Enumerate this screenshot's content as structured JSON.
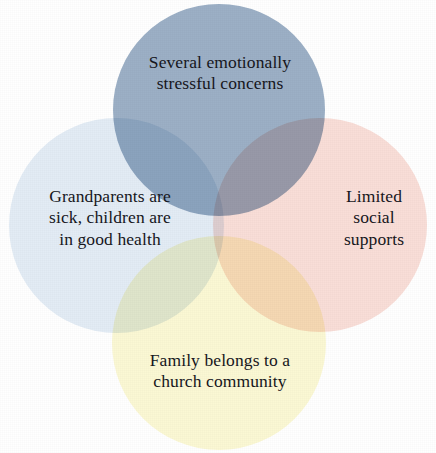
{
  "diagram": {
    "type": "venn",
    "set_count": 4,
    "background_color": "#ffffff",
    "text_color": "#16161c",
    "blend_mode": "multiply",
    "sets": [
      {
        "id": "top",
        "position": "top",
        "color": "#9cb0c6",
        "color_name": "slate blue",
        "lines": [
          "Several emotionally",
          "stressful concerns"
        ],
        "text": "Several emotionally stressful concerns"
      },
      {
        "id": "left",
        "position": "left",
        "color": "#e3ecf5",
        "color_name": "pale blue",
        "lines": [
          "Grandparents are",
          "sick, children are",
          "in good health"
        ],
        "text": "Grandparents are sick, children are in good health"
      },
      {
        "id": "right",
        "position": "right",
        "color": "#f9ded8",
        "color_name": "pale pink",
        "lines": [
          "Limited",
          "social",
          "supports"
        ],
        "text": "Limited social supports"
      },
      {
        "id": "bottom",
        "position": "bottom",
        "color": "#fbf8d4",
        "color_name": "pale cream yellow",
        "lines": [
          "Family belongs to a",
          "church community"
        ],
        "text": "Family belongs to a church community"
      }
    ],
    "overlap_colors": {
      "top_right": "#6e6e80",
      "top_left": "#8fa3ba",
      "bottom_right": "#f2c9a4",
      "bottom_left": "#c9c3b0"
    }
  }
}
